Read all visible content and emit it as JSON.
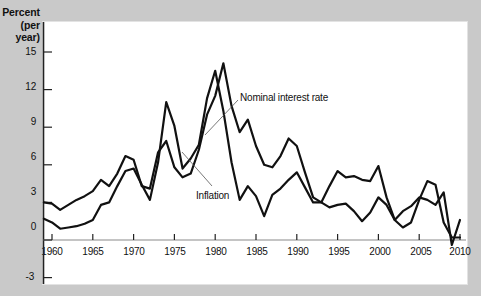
{
  "chart_data": {
    "type": "line",
    "title": "",
    "xlabel": "",
    "ylabel": "Percent",
    "ylabel_sub": "(per year)",
    "xlim": [
      1959,
      2010
    ],
    "ylim": [
      -3,
      16.5
    ],
    "grid": false,
    "legend_position": "inline-annotations",
    "x_ticks": [
      1960,
      1965,
      1970,
      1975,
      1980,
      1985,
      1990,
      1995,
      2000,
      2005,
      2010
    ],
    "y_ticks": [
      15,
      12,
      9,
      6,
      3,
      0,
      -3
    ],
    "x": [
      1959,
      1960,
      1961,
      1962,
      1963,
      1964,
      1965,
      1966,
      1967,
      1968,
      1969,
      1970,
      1971,
      1972,
      1973,
      1974,
      1975,
      1976,
      1977,
      1978,
      1979,
      1980,
      1981,
      1982,
      1983,
      1984,
      1985,
      1986,
      1987,
      1988,
      1989,
      1990,
      1991,
      1992,
      1993,
      1994,
      1995,
      1996,
      1997,
      1998,
      1999,
      2000,
      2001,
      2002,
      2003,
      2004,
      2005,
      2006,
      2007,
      2008,
      2009,
      2010
    ],
    "series": [
      {
        "name": "Nominal interest rate",
        "color": "#111111",
        "values": [
          3.0,
          2.9,
          2.4,
          2.8,
          3.2,
          3.5,
          3.9,
          4.8,
          4.3,
          5.3,
          6.7,
          6.4,
          4.3,
          4.1,
          7.0,
          7.9,
          5.8,
          5.0,
          5.3,
          7.2,
          10.0,
          11.5,
          14.1,
          10.7,
          8.6,
          9.6,
          7.5,
          6.0,
          5.8,
          6.7,
          8.1,
          7.5,
          5.4,
          3.4,
          3.0,
          4.3,
          5.5,
          5.0,
          5.1,
          4.8,
          4.7,
          5.9,
          3.4,
          1.6,
          1.0,
          1.4,
          3.2,
          4.7,
          4.4,
          1.4,
          0.2,
          0.2
        ],
        "linewidth": 2.2
      },
      {
        "name": "Inflation",
        "color": "#111111",
        "values": [
          1.7,
          1.4,
          0.9,
          1.0,
          1.1,
          1.3,
          1.6,
          2.8,
          3.0,
          4.3,
          5.5,
          5.7,
          4.4,
          3.2,
          6.2,
          11.0,
          9.1,
          5.7,
          6.5,
          7.6,
          11.3,
          13.5,
          10.3,
          6.2,
          3.2,
          4.3,
          3.5,
          1.9,
          3.6,
          4.1,
          4.8,
          5.4,
          4.2,
          3.0,
          3.0,
          2.6,
          2.8,
          2.9,
          2.3,
          1.5,
          2.2,
          3.4,
          2.8,
          1.6,
          2.3,
          2.7,
          3.4,
          3.2,
          2.8,
          3.8,
          -0.4,
          1.6
        ],
        "linewidth": 2.2
      }
    ],
    "annotations": [
      {
        "text": "Nominal interest rate",
        "series": "Nominal interest rate"
      },
      {
        "text": "Inflation",
        "series": "Inflation"
      }
    ]
  }
}
